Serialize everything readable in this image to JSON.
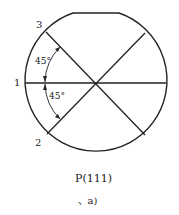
{
  "diagram": {
    "type": "wafer-orientation",
    "labels": {
      "one": "1",
      "two": "2",
      "three": "3"
    },
    "angles": {
      "upper": "45°",
      "lower": "45°"
    },
    "caption": {
      "title": "P(111)",
      "sub": "、a)"
    },
    "colors": {
      "stroke": "#222222",
      "background": "#ffffff"
    }
  }
}
